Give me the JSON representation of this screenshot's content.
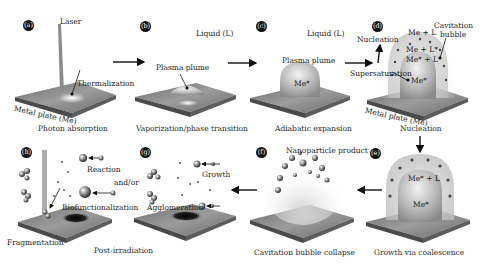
{
  "panels": [
    {
      "id": "a",
      "badge": "(a)",
      "caption": "Photon absorption",
      "labels": {
        "laser": "Laser",
        "thermalization": "Thermalization",
        "plate": "Metal plate (Me)"
      }
    },
    {
      "id": "b",
      "badge": "(b)",
      "caption": "Vaporization/phase transition",
      "labels": {
        "liquid": "Liquid (L)",
        "plume": "Plasma plume"
      }
    },
    {
      "id": "c",
      "badge": "(c)",
      "caption": "Adiabatic expansion",
      "labels": {
        "liquid": "Liquid (L)",
        "plume": "Plasma plume",
        "me_star": "Me*"
      }
    },
    {
      "id": "d",
      "badge": "(d)",
      "caption": "Nucleation",
      "labels": {
        "nucleation": "Nucleation",
        "cavitation": "Cavitation",
        "bubble": "bubble",
        "me_l": "Me + L",
        "me_lstar": "Me + L*",
        "mestar_lstar": "Me* + L*",
        "supersaturation": "Supersaturation",
        "me_star": "Me*",
        "plate": "Metal plate (Me)"
      }
    },
    {
      "id": "e",
      "badge": "(e)",
      "caption": "Growth via coalescence",
      "labels": {
        "mestar_l": "Me* + L",
        "me_star": "Me*"
      }
    },
    {
      "id": "f",
      "badge": "(f)",
      "caption": "Cavitation bubble collapse",
      "labels": {
        "product": "Nanoparticle product"
      }
    },
    {
      "id": "g",
      "badge": "(g)",
      "caption": "",
      "labels": {
        "growth": "Growth",
        "agglomeration": "Agglomeration"
      }
    },
    {
      "id": "h",
      "badge": "(h)",
      "caption": "Post-irradiation",
      "labels": {
        "reaction": "Reaction",
        "andor": "and/or",
        "biofunc": "Biofunctionalization",
        "fragmentation": "Fragmentation"
      }
    }
  ],
  "colors": {
    "plate_top": "#8a8a8a",
    "plate_side": "#555555",
    "arrow": "#111111",
    "bubble": "#c8c8c8"
  }
}
